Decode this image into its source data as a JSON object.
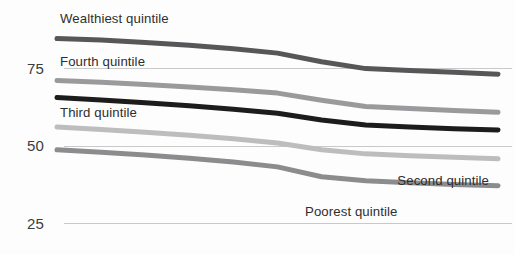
{
  "chart_data": {
    "type": "line",
    "title": "",
    "subtitle": "",
    "xlabel": "",
    "ylabel": "",
    "ylim": [
      25,
      100
    ],
    "xlim": [
      0,
      10
    ],
    "grid": true,
    "grid_axis": "y",
    "legend": "inline-labels",
    "legend_position": "inline",
    "yticks": [
      25,
      50,
      75
    ],
    "ytick_labels": [
      "25",
      "50",
      "75"
    ],
    "xticks": [],
    "xtick_labels": [],
    "x": [
      0,
      1,
      2,
      3,
      4,
      5,
      6,
      7,
      8,
      9,
      10
    ],
    "series": [
      {
        "name": "Wealthiest quintile",
        "color": "#57575a",
        "linewidth": 5.0,
        "values": [
          84.5,
          84.0,
          83.2,
          82.3,
          81.2,
          79.8,
          77.0,
          74.8,
          74.2,
          73.6,
          73.0
        ],
        "label_x": 60,
        "label_y": 23,
        "label_anchor": "start"
      },
      {
        "name": "Fourth quintile",
        "color": "#9a9a9d",
        "linewidth": 5.0,
        "values": [
          71.0,
          70.4,
          69.7,
          68.9,
          68.0,
          66.9,
          64.6,
          62.6,
          61.9,
          61.3,
          60.7
        ],
        "label_x": 60,
        "label_y": 66,
        "label_anchor": "start"
      },
      {
        "name": "Third quintile",
        "color": "#1c1c1c",
        "linewidth": 5.0,
        "values": [
          65.5,
          64.7,
          63.8,
          62.8,
          61.7,
          60.4,
          58.2,
          56.6,
          56.0,
          55.4,
          55.0
        ],
        "label_x": 60,
        "label_y": 117,
        "label_anchor": "start"
      },
      {
        "name": "Second quintile",
        "color": "#bdbdbd",
        "linewidth": 5.0,
        "values": [
          56.0,
          55.2,
          54.3,
          53.3,
          52.2,
          50.8,
          48.6,
          47.3,
          46.7,
          46.2,
          45.7
        ],
        "label_x": 489,
        "label_y": 185,
        "label_anchor": "end"
      },
      {
        "name": "Poorest quintile",
        "color": "#8c8c8f",
        "linewidth": 5.0,
        "values": [
          48.6,
          47.8,
          46.9,
          45.9,
          44.7,
          43.1,
          39.9,
          38.6,
          38.0,
          37.4,
          37.0
        ],
        "label_x": 305,
        "label_y": 216,
        "label_anchor": "start"
      }
    ],
    "gridline_color": "#c9c9c9",
    "tick_mark_color": "#9e9e9e",
    "background_color": "#fdfdfd",
    "axis_label_color": "#3c3c3c"
  },
  "axis": {
    "tick_75": "75",
    "tick_50": "50",
    "tick_25": "25"
  },
  "labels": {
    "wealthiest": "Wealthiest quintile",
    "fourth": "Fourth quintile",
    "third": "Third quintile",
    "second": "Second quintile",
    "poorest": "Poorest quintile"
  }
}
